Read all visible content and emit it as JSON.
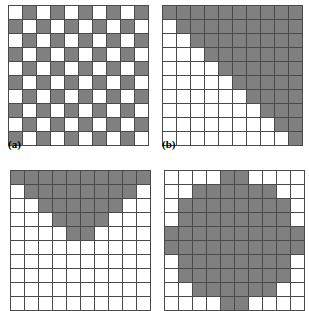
{
  "figure": {
    "title": "",
    "grid_size": 10,
    "colors": {
      "on": "#808080",
      "off": "#ffffff",
      "gridline": "#4a4a4a"
    }
  },
  "panels": [
    {
      "id": "a",
      "caption": "(a)",
      "caption_visible": true,
      "pattern_name": "checkerboard",
      "cell_px": 13,
      "rows": [
        [
          0,
          1,
          0,
          1,
          0,
          1,
          0,
          1,
          0,
          1
        ],
        [
          1,
          0,
          1,
          0,
          1,
          0,
          1,
          0,
          1,
          0
        ],
        [
          0,
          1,
          0,
          1,
          0,
          1,
          0,
          1,
          0,
          1
        ],
        [
          1,
          0,
          1,
          0,
          1,
          0,
          1,
          0,
          1,
          0
        ],
        [
          0,
          1,
          0,
          1,
          0,
          1,
          0,
          1,
          0,
          1
        ],
        [
          1,
          0,
          1,
          0,
          1,
          0,
          1,
          0,
          1,
          0
        ],
        [
          0,
          1,
          0,
          1,
          0,
          1,
          0,
          1,
          0,
          1
        ],
        [
          1,
          0,
          1,
          0,
          1,
          0,
          1,
          0,
          1,
          0
        ],
        [
          0,
          1,
          0,
          1,
          0,
          1,
          0,
          1,
          0,
          1
        ],
        [
          1,
          0,
          1,
          0,
          1,
          0,
          1,
          0,
          1,
          0
        ]
      ]
    },
    {
      "id": "b",
      "caption": "(b)",
      "caption_visible": true,
      "pattern_name": "upper-triangular-staircase",
      "cell_px": 13,
      "rows": [
        [
          1,
          1,
          1,
          1,
          1,
          1,
          1,
          1,
          1,
          1
        ],
        [
          0,
          1,
          1,
          1,
          1,
          1,
          1,
          1,
          1,
          1
        ],
        [
          0,
          0,
          1,
          1,
          1,
          1,
          1,
          1,
          1,
          1
        ],
        [
          0,
          0,
          0,
          1,
          1,
          1,
          1,
          1,
          1,
          1
        ],
        [
          0,
          0,
          0,
          0,
          1,
          1,
          1,
          1,
          1,
          1
        ],
        [
          0,
          0,
          0,
          0,
          0,
          1,
          1,
          1,
          1,
          1
        ],
        [
          0,
          0,
          0,
          0,
          0,
          0,
          1,
          1,
          1,
          1
        ],
        [
          0,
          0,
          0,
          0,
          0,
          0,
          0,
          1,
          1,
          1
        ],
        [
          0,
          0,
          0,
          0,
          0,
          0,
          0,
          0,
          1,
          1
        ],
        [
          0,
          0,
          0,
          0,
          0,
          0,
          0,
          0,
          0,
          1
        ]
      ]
    },
    {
      "id": "c",
      "caption": "(c)",
      "caption_visible": false,
      "pattern_name": "downward-triangle",
      "cell_px": 13,
      "rows": [
        [
          1,
          1,
          1,
          1,
          1,
          1,
          1,
          1,
          1,
          1
        ],
        [
          0,
          1,
          1,
          1,
          1,
          1,
          1,
          1,
          1,
          0
        ],
        [
          0,
          0,
          1,
          1,
          1,
          1,
          1,
          1,
          0,
          0
        ],
        [
          0,
          0,
          0,
          1,
          1,
          1,
          1,
          0,
          0,
          0
        ],
        [
          0,
          0,
          0,
          0,
          1,
          1,
          0,
          0,
          0,
          0
        ],
        [
          0,
          0,
          0,
          0,
          0,
          0,
          0,
          0,
          0,
          0
        ],
        [
          0,
          0,
          0,
          0,
          0,
          0,
          0,
          0,
          0,
          0
        ],
        [
          0,
          0,
          0,
          0,
          0,
          0,
          0,
          0,
          0,
          0
        ],
        [
          0,
          0,
          0,
          0,
          0,
          0,
          0,
          0,
          0,
          0
        ],
        [
          0,
          0,
          0,
          0,
          0,
          0,
          0,
          0,
          0,
          0
        ]
      ]
    },
    {
      "id": "d",
      "caption": "(d)",
      "caption_visible": false,
      "pattern_name": "disk",
      "cell_px": 13,
      "rows": [
        [
          0,
          0,
          0,
          0,
          1,
          1,
          0,
          0,
          0,
          0
        ],
        [
          0,
          0,
          1,
          1,
          1,
          1,
          1,
          1,
          0,
          0
        ],
        [
          0,
          1,
          1,
          1,
          1,
          1,
          1,
          1,
          1,
          0
        ],
        [
          0,
          1,
          1,
          1,
          1,
          1,
          1,
          1,
          1,
          0
        ],
        [
          1,
          1,
          1,
          1,
          1,
          1,
          1,
          1,
          1,
          1
        ],
        [
          1,
          1,
          1,
          1,
          1,
          1,
          1,
          1,
          1,
          1
        ],
        [
          0,
          1,
          1,
          1,
          1,
          1,
          1,
          1,
          1,
          0
        ],
        [
          0,
          1,
          1,
          1,
          1,
          1,
          1,
          1,
          1,
          0
        ],
        [
          0,
          0,
          1,
          1,
          1,
          1,
          1,
          1,
          0,
          0
        ],
        [
          0,
          0,
          0,
          0,
          1,
          1,
          0,
          0,
          0,
          0
        ]
      ]
    }
  ]
}
